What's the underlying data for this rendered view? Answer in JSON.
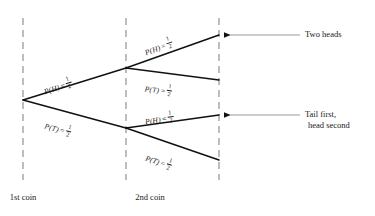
{
  "diagram": {
    "type": "probability-tree",
    "colors": {
      "branch": "#111111",
      "dashed_guide": "#9a9a9a",
      "arrow_line": "#8f8f8f",
      "arrow_head": "#111111",
      "text": "#1a1a1a",
      "background": "#ffffff"
    },
    "guides": [
      {
        "name": "1st-coin-guide",
        "x": 23,
        "y_top": 18,
        "y_bottom": 180
      },
      {
        "name": "2nd-coin-guide",
        "x": 126,
        "y_top": 18,
        "y_bottom": 180
      },
      {
        "name": "outcome-guide",
        "x": 219,
        "y_top": 18,
        "y_bottom": 180
      }
    ],
    "nodes": [
      {
        "name": "root",
        "x": 23,
        "y": 100
      },
      {
        "name": "first-heads",
        "x": 126,
        "y": 68
      },
      {
        "name": "first-tails",
        "x": 126,
        "y": 128
      },
      {
        "name": "outcome-hh",
        "x": 219,
        "y": 35
      },
      {
        "name": "outcome-ht",
        "x": 219,
        "y": 80
      },
      {
        "name": "outcome-th",
        "x": 219,
        "y": 115
      },
      {
        "name": "outcome-tt",
        "x": 219,
        "y": 160
      }
    ],
    "branches": [
      {
        "name": "branch-first-heads",
        "from": "root",
        "to": "first-heads",
        "event": "P(H)",
        "equals": "=",
        "numerator": "1",
        "denominator": "2",
        "label_x": 44,
        "label_y": 84,
        "rotation": -17.3
      },
      {
        "name": "branch-first-tails",
        "from": "root",
        "to": "first-tails",
        "event": "P(T)",
        "equals": "=",
        "numerator": "1",
        "denominator": "2",
        "label_x": 45,
        "label_y": 118,
        "rotation": 16.2
      },
      {
        "name": "branch-second-heads-upper",
        "from": "first-heads",
        "to": "outcome-hh",
        "event": "P(H)",
        "equals": "=",
        "numerator": "1",
        "denominator": "2",
        "label_x": 145,
        "label_y": 45,
        "rotation": -19.5
      },
      {
        "name": "branch-second-tails-upper",
        "from": "first-heads",
        "to": "outcome-ht",
        "event": "P(T)",
        "equals": "=",
        "numerator": "1",
        "denominator": "2",
        "label_x": 145,
        "label_y": 81,
        "rotation": 7.4
      },
      {
        "name": "branch-second-heads-lower",
        "from": "first-tails",
        "to": "outcome-th",
        "event": "P(H)",
        "equals": "=",
        "numerator": "1",
        "denominator": "2",
        "label_x": 145,
        "label_y": 114,
        "rotation": -8.0
      },
      {
        "name": "branch-second-tails-lower",
        "from": "first-tails",
        "to": "outcome-tt",
        "event": "P(T)",
        "equals": "=",
        "numerator": "1",
        "denominator": "2",
        "label_x": 146,
        "label_y": 150,
        "rotation": 19.0
      }
    ],
    "callouts": [
      {
        "name": "callout-two-heads",
        "points_to": "outcome-hh",
        "arrow_y": 35,
        "arrow_from_x": 300,
        "arrow_to_x": 221,
        "text_x": 305,
        "text_y": 29,
        "lines": [
          "Two heads"
        ]
      },
      {
        "name": "callout-tail-first-head-second",
        "points_to": "outcome-th",
        "arrow_y": 115,
        "arrow_from_x": 300,
        "arrow_to_x": 221,
        "text_x": 305,
        "text_y": 109,
        "lines": [
          "Tail first,",
          "head second"
        ]
      }
    ],
    "stage_labels": [
      {
        "name": "stage-label-first-coin",
        "text": "1st coin",
        "x": 23,
        "y": 192
      },
      {
        "name": "stage-label-second-coin",
        "text": "2nd coin",
        "x": 150,
        "y": 192
      }
    ]
  }
}
